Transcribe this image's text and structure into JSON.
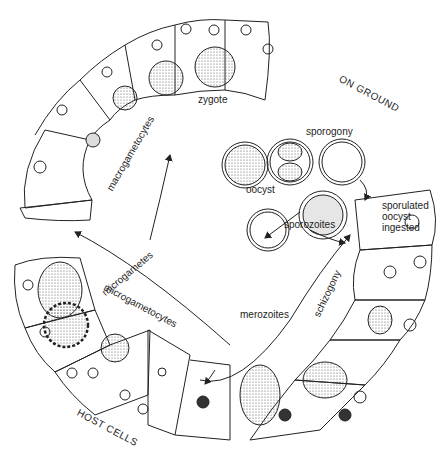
{
  "diagram": {
    "type": "life-cycle",
    "labels": {
      "on_ground": "ON GROUND",
      "sporogony": "sporogony",
      "oocyst": "oocyst",
      "sporulated": "sporulated",
      "oocyst2": "oocyst",
      "ingested": "ingested",
      "sporozoites": "sporozoites",
      "schizogony": "schizogony",
      "merozoites": "merozoites",
      "microgametocytes": "microgametocytes",
      "microgametes": "microgametes",
      "macrogametocytes": "macrogametocytes",
      "zygote": "zygote",
      "host_cells": "HOST CELLS"
    },
    "stages": [
      "oocyst",
      "sporogony",
      "sporulated oocyst ingested",
      "sporozoites",
      "schizogony",
      "merozoites",
      "microgametocytes",
      "microgametes",
      "macrogametocytes",
      "zygote"
    ],
    "colors": {
      "line": "#222222",
      "stipple": "#bdbdbd",
      "background": "#ffffff"
    }
  }
}
